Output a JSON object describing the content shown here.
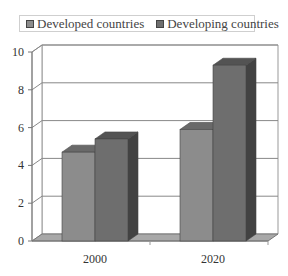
{
  "chart_data": {
    "type": "bar",
    "style": "3d-clustered-column",
    "title": "",
    "xlabel": "",
    "ylabel": "",
    "categories": [
      "2000",
      "2020"
    ],
    "series": [
      {
        "name": "Developed countries",
        "values": [
          4.7,
          5.9
        ],
        "color": "#8c8c8c"
      },
      {
        "name": "Developing countries",
        "values": [
          5.4,
          9.3
        ],
        "color": "#6e6e6e"
      }
    ],
    "ylim": [
      0,
      10
    ],
    "yticks": [
      "0",
      "2",
      "4",
      "6",
      "8",
      "10"
    ],
    "grid": true,
    "legend_position": "top"
  },
  "legend": {
    "items": [
      {
        "label": "Developed countries",
        "color": "#8c8c8c"
      },
      {
        "label": "Developing countries",
        "color": "#6e6e6e"
      }
    ]
  }
}
